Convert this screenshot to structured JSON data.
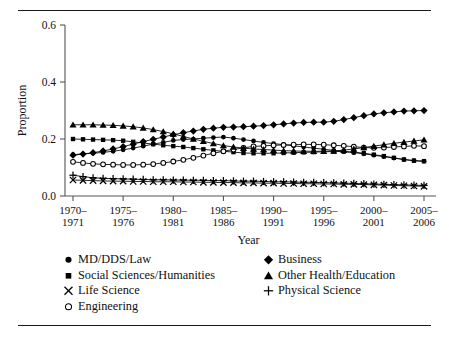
{
  "figure": {
    "top_rule": "",
    "bottom_rule": ""
  },
  "chart_data": {
    "type": "line",
    "title": "",
    "xlabel": "Year",
    "ylabel": "Proportion",
    "ylim": [
      0.0,
      0.6
    ],
    "yticks": [
      0.0,
      0.2,
      0.4,
      0.6
    ],
    "ytick_labels": [
      "0.0",
      "0.2",
      "0.4",
      "0.6"
    ],
    "grid": false,
    "legend_position": "below-axes",
    "x": [
      "1970-1971",
      "1971-1972",
      "1972-1973",
      "1973-1974",
      "1974-1975",
      "1975-1976",
      "1976-1977",
      "1977-1978",
      "1978-1979",
      "1979-1980",
      "1980-1981",
      "1981-1982",
      "1982-1983",
      "1983-1984",
      "1984-1985",
      "1985-1986",
      "1986-1987",
      "1987-1988",
      "1988-1989",
      "1989-1990",
      "1990-1991",
      "1991-1992",
      "1992-1993",
      "1993-1994",
      "1994-1995",
      "1995-1996",
      "1996-1997",
      "1997-1998",
      "1998-1999",
      "1999-2000",
      "2000-2001",
      "2001-2002",
      "2002-2003",
      "2003-2004",
      "2004-2005",
      "2005-2006"
    ],
    "xtick_labels": [
      "1970–\n1971",
      "1975–\n1976",
      "1980–\n1981",
      "1985–\n1986",
      "1990–\n1991",
      "1995–\n1996",
      "2000–\n2001",
      "2005–\n2006"
    ],
    "xtick_indices": [
      0,
      5,
      10,
      15,
      20,
      25,
      30,
      35
    ],
    "series": [
      {
        "name": "MD/DDS/Law",
        "marker": "circle-filled",
        "values": [
          0.145,
          0.148,
          0.15,
          0.153,
          0.157,
          0.162,
          0.168,
          0.175,
          0.182,
          0.188,
          0.195,
          0.198,
          0.2,
          0.203,
          0.205,
          0.207,
          0.203,
          0.198,
          0.193,
          0.188,
          0.184,
          0.18,
          0.176,
          0.172,
          0.168,
          0.164,
          0.16,
          0.156,
          0.152,
          0.148,
          0.143,
          0.138,
          0.133,
          0.128,
          0.124,
          0.122
        ]
      },
      {
        "name": "Social Sciences/Humanities",
        "marker": "square-filled",
        "values": [
          0.2,
          0.199,
          0.198,
          0.197,
          0.196,
          0.194,
          0.19,
          0.186,
          0.182,
          0.178,
          0.175,
          0.172,
          0.168,
          0.164,
          0.16,
          0.157,
          0.154,
          0.151,
          0.15,
          0.15,
          0.15,
          0.151,
          0.152,
          0.153,
          0.154,
          0.155,
          0.156,
          0.156,
          0.154,
          0.15,
          0.145,
          0.14,
          0.134,
          0.128,
          0.124,
          0.122
        ]
      },
      {
        "name": "Life Science",
        "marker": "x",
        "values": [
          0.056,
          0.055,
          0.054,
          0.053,
          0.052,
          0.052,
          0.051,
          0.051,
          0.05,
          0.05,
          0.05,
          0.049,
          0.049,
          0.048,
          0.048,
          0.047,
          0.047,
          0.046,
          0.046,
          0.045,
          0.045,
          0.044,
          0.044,
          0.043,
          0.043,
          0.042,
          0.042,
          0.041,
          0.041,
          0.04,
          0.039,
          0.038,
          0.037,
          0.036,
          0.035,
          0.034
        ]
      },
      {
        "name": "Engineering",
        "marker": "circle-open",
        "values": [
          0.12,
          0.116,
          0.113,
          0.111,
          0.11,
          0.109,
          0.109,
          0.11,
          0.112,
          0.116,
          0.121,
          0.127,
          0.134,
          0.142,
          0.15,
          0.157,
          0.163,
          0.169,
          0.174,
          0.176,
          0.178,
          0.179,
          0.18,
          0.181,
          0.181,
          0.18,
          0.178,
          0.176,
          0.173,
          0.17,
          0.169,
          0.17,
          0.172,
          0.174,
          0.176,
          0.175
        ]
      },
      {
        "name": "Business",
        "marker": "diamond-filled",
        "values": [
          0.143,
          0.147,
          0.152,
          0.158,
          0.165,
          0.173,
          0.182,
          0.191,
          0.199,
          0.207,
          0.215,
          0.222,
          0.228,
          0.234,
          0.238,
          0.241,
          0.242,
          0.243,
          0.245,
          0.247,
          0.25,
          0.253,
          0.256,
          0.258,
          0.259,
          0.259,
          0.262,
          0.268,
          0.275,
          0.282,
          0.288,
          0.292,
          0.295,
          0.298,
          0.299,
          0.3
        ]
      },
      {
        "name": "Other Health/Education",
        "marker": "triangle-filled",
        "values": [
          0.25,
          0.25,
          0.25,
          0.249,
          0.248,
          0.246,
          0.243,
          0.239,
          0.233,
          0.226,
          0.218,
          0.209,
          0.2,
          0.192,
          0.184,
          0.177,
          0.172,
          0.168,
          0.165,
          0.163,
          0.161,
          0.159,
          0.158,
          0.157,
          0.157,
          0.157,
          0.158,
          0.161,
          0.165,
          0.17,
          0.175,
          0.18,
          0.185,
          0.189,
          0.193,
          0.197
        ]
      },
      {
        "name": "Physical Science",
        "marker": "plus",
        "values": [
          0.073,
          0.068,
          0.064,
          0.062,
          0.061,
          0.06,
          0.059,
          0.058,
          0.057,
          0.057,
          0.056,
          0.056,
          0.055,
          0.055,
          0.054,
          0.054,
          0.053,
          0.052,
          0.052,
          0.051,
          0.05,
          0.05,
          0.049,
          0.048,
          0.048,
          0.047,
          0.046,
          0.045,
          0.044,
          0.043,
          0.042,
          0.041,
          0.04,
          0.039,
          0.038,
          0.037
        ]
      }
    ]
  },
  "legend": {
    "left_column": [
      {
        "marker": "circle-filled",
        "label": "MD/DDS/Law"
      },
      {
        "marker": "square-filled",
        "label": "Social Sciences/Humanities"
      },
      {
        "marker": "x",
        "label": "Life Science"
      },
      {
        "marker": "circle-open",
        "label": "Engineering"
      }
    ],
    "right_column": [
      {
        "marker": "diamond-filled",
        "label": "Business"
      },
      {
        "marker": "triangle-filled",
        "label": "Other Health/Education"
      },
      {
        "marker": "plus",
        "label": "Physical Science"
      }
    ]
  }
}
